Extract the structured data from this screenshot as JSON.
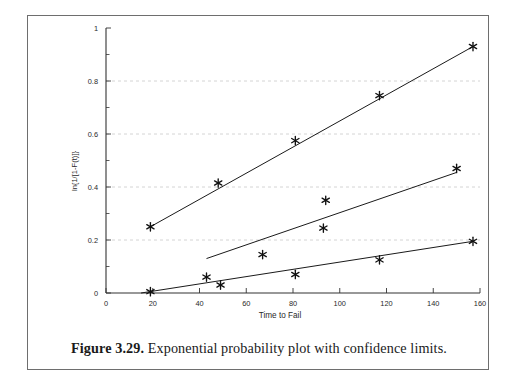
{
  "figure": {
    "caption_label": "Figure 3.29.",
    "caption_text": " Exponential probability plot with confidence limits.",
    "frame_color": "#6e6e6e"
  },
  "chart_data": {
    "type": "scatter",
    "title": "",
    "xlabel": "Time to Fail",
    "ylabel": "ln{1/[1-F(t)]}",
    "xlim": [
      0,
      160
    ],
    "ylim": [
      0,
      1
    ],
    "xticks": [
      0,
      20,
      40,
      60,
      80,
      100,
      120,
      140,
      160
    ],
    "xticklabels": [
      "0",
      "20",
      "40",
      "60",
      "80",
      "100",
      "120",
      "140",
      "160"
    ],
    "yticks": [
      0,
      0.2,
      0.4,
      0.6,
      0.8,
      1
    ],
    "yticklabels": [
      "0",
      "0.2",
      "0.4",
      "0.6",
      "0.8",
      "1"
    ],
    "y_minor_ticks": [
      0.1,
      0.3,
      0.5,
      0.7,
      0.9
    ],
    "grid": "horizontal-dashed",
    "grid_color": "#c9c9c9",
    "legend": "none",
    "marker": "asterisk",
    "marker_color": "#111111",
    "line_color": "#1a1a1a",
    "series": [
      {
        "name": "upper-confidence-limit",
        "role": "upper limit",
        "points": [
          {
            "x": 19,
            "y": 0.25
          },
          {
            "x": 48,
            "y": 0.415
          },
          {
            "x": 81,
            "y": 0.575
          },
          {
            "x": 117,
            "y": 0.745
          },
          {
            "x": 157,
            "y": 0.93
          }
        ],
        "fit_line": {
          "x0": 19,
          "y0": 0.25,
          "x1": 157,
          "y1": 0.93
        }
      },
      {
        "name": "median-fit",
        "role": "best fit",
        "points": [
          {
            "x": 43,
            "y": 0.06
          },
          {
            "x": 67,
            "y": 0.145
          },
          {
            "x": 93,
            "y": 0.245
          },
          {
            "x": 94,
            "y": 0.35
          },
          {
            "x": 150,
            "y": 0.47
          }
        ],
        "fit_line": {
          "x0": 43,
          "y0": 0.13,
          "x1": 150,
          "y1": 0.455
        }
      },
      {
        "name": "lower-confidence-limit",
        "role": "lower limit",
        "points": [
          {
            "x": 19,
            "y": 0.005
          },
          {
            "x": 49,
            "y": 0.03
          },
          {
            "x": 81,
            "y": 0.07
          },
          {
            "x": 117,
            "y": 0.125
          },
          {
            "x": 157,
            "y": 0.195
          }
        ],
        "fit_line": {
          "x0": 15,
          "y0": 0.0,
          "x1": 157,
          "y1": 0.195
        }
      }
    ]
  }
}
